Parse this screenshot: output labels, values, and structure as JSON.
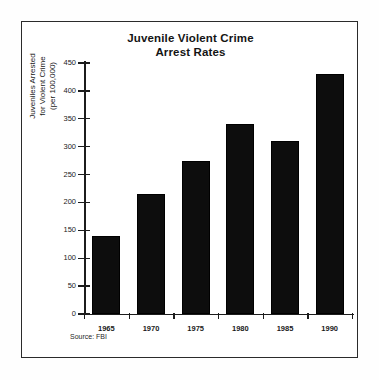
{
  "figure": {
    "source_note": "Source: FBI"
  },
  "chart_data": {
    "type": "bar",
    "title": "Juvenile Violent Crime Arrest Rates",
    "title_lines": [
      "Juvenile Violent Crime",
      "Arrest Rates"
    ],
    "categories": [
      "1965",
      "1970",
      "1975",
      "1980",
      "1985",
      "1990"
    ],
    "values": [
      140,
      215,
      275,
      340,
      310,
      430
    ],
    "xlabel": "",
    "ylabel": "Juveniles Arrested for Violent Crime (per 100,000)",
    "ylabel_lines": [
      "Juveniles Arrested",
      "for Violent Crime",
      "(per 100,000)"
    ],
    "ylim": [
      0,
      450
    ],
    "yticks": [
      0,
      50,
      100,
      150,
      200,
      250,
      300,
      350,
      400,
      450
    ],
    "ytick_labels": [
      "0",
      "50",
      "100",
      "150",
      "200",
      "250",
      "300",
      "350",
      "400",
      "450"
    ],
    "grid": false,
    "legend": false,
    "bar_color": "#0d0d0d",
    "background_color": "#ffffff"
  }
}
